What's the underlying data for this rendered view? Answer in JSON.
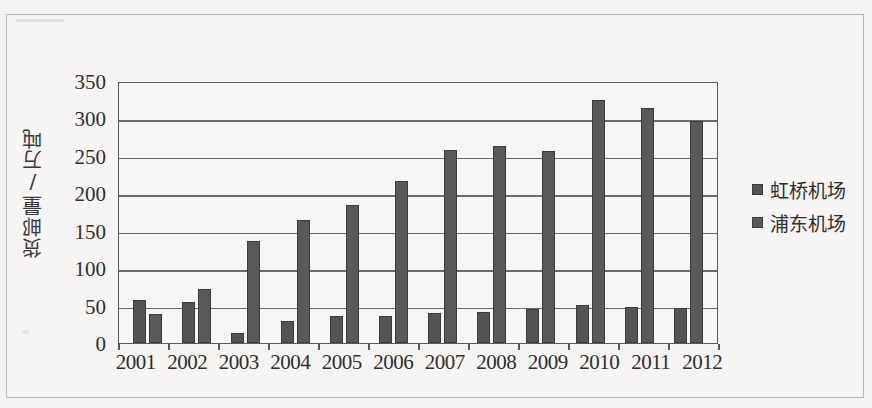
{
  "chart_data": {
    "type": "bar",
    "title": "",
    "subtitle": "",
    "xlabel": "",
    "ylabel": "货邮量/万吨",
    "ylim": [
      0,
      350
    ],
    "yticks": [
      350,
      300,
      250,
      200,
      150,
      100,
      50,
      0
    ],
    "grid": true,
    "legend_position": "right",
    "categories": [
      "2001",
      "2002",
      "2003",
      "2004",
      "2005",
      "2006",
      "2007",
      "2008",
      "2009",
      "2010",
      "2011",
      "2012"
    ],
    "series": [
      {
        "name": "虹桥机场",
        "color": "#555452",
        "values": [
          58,
          55,
          14,
          29,
          36,
          36,
          40,
          42,
          45,
          51,
          48,
          47
        ]
      },
      {
        "name": "浦东机场",
        "color": "#5a5958",
        "values": [
          39,
          72,
          136,
          164,
          185,
          217,
          258,
          263,
          256,
          325,
          314,
          296
        ]
      }
    ]
  },
  "figure": {
    "background_color": "#f4f3f1",
    "plot_background_color": "#f7f6f4",
    "axis_color": "#5b5b5b"
  }
}
